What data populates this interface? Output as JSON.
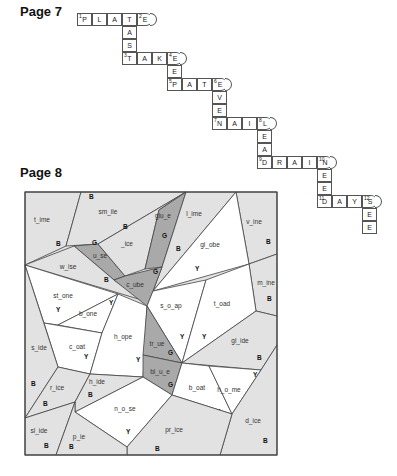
{
  "page7": {
    "label": "Page 7",
    "cells": [
      {
        "x": 77,
        "y": 13,
        "ch": "P",
        "num": "1"
      },
      {
        "x": 92,
        "y": 13,
        "ch": "L"
      },
      {
        "x": 107,
        "y": 13,
        "ch": "A"
      },
      {
        "x": 122,
        "y": 13,
        "ch": "T"
      },
      {
        "x": 137,
        "y": 13,
        "ch": "E",
        "num": "2",
        "end": true
      },
      {
        "x": 122,
        "y": 26,
        "ch": "A"
      },
      {
        "x": 122,
        "y": 39,
        "ch": "S"
      },
      {
        "x": 122,
        "y": 52,
        "ch": "T",
        "num": "3"
      },
      {
        "x": 137,
        "y": 52,
        "ch": "A"
      },
      {
        "x": 152,
        "y": 52,
        "ch": "K"
      },
      {
        "x": 167,
        "y": 52,
        "ch": "E",
        "num": "4",
        "end": true
      },
      {
        "x": 167,
        "y": 65,
        "ch": "E"
      },
      {
        "x": 167,
        "y": 78,
        "ch": "P",
        "num": "5"
      },
      {
        "x": 182,
        "y": 78,
        "ch": "A"
      },
      {
        "x": 197,
        "y": 78,
        "ch": "T"
      },
      {
        "x": 212,
        "y": 78,
        "ch": "E",
        "num": "6",
        "end": true
      },
      {
        "x": 212,
        "y": 91,
        "ch": "V"
      },
      {
        "x": 212,
        "y": 104,
        "ch": "E"
      },
      {
        "x": 212,
        "y": 117,
        "ch": "N",
        "num": "7"
      },
      {
        "x": 227,
        "y": 117,
        "ch": "A"
      },
      {
        "x": 242,
        "y": 117,
        "ch": "I"
      },
      {
        "x": 257,
        "y": 117,
        "ch": "L",
        "num": "8",
        "end": true
      },
      {
        "x": 257,
        "y": 130,
        "ch": "E"
      },
      {
        "x": 257,
        "y": 143,
        "ch": "A"
      },
      {
        "x": 257,
        "y": 156,
        "ch": "D",
        "num": "9"
      },
      {
        "x": 272,
        "y": 156,
        "ch": "R"
      },
      {
        "x": 287,
        "y": 156,
        "ch": "A"
      },
      {
        "x": 302,
        "y": 156,
        "ch": "I"
      },
      {
        "x": 317,
        "y": 156,
        "ch": "N",
        "num": "10",
        "end": true
      },
      {
        "x": 317,
        "y": 169,
        "ch": "E"
      },
      {
        "x": 317,
        "y": 182,
        "ch": "E"
      },
      {
        "x": 317,
        "y": 195,
        "ch": "D",
        "num": "11"
      },
      {
        "x": 332,
        "y": 195,
        "ch": "A"
      },
      {
        "x": 347,
        "y": 195,
        "ch": "Y"
      },
      {
        "x": 362,
        "y": 195,
        "ch": "S",
        "num": "12",
        "end": true
      },
      {
        "x": 362,
        "y": 208,
        "ch": "E"
      },
      {
        "x": 362,
        "y": 221,
        "ch": "E"
      }
    ]
  },
  "page8": {
    "label": "Page 8",
    "colors": {
      "B": "#e2e2e2",
      "G": "#a9a9a9",
      "Y": "#ffffff",
      "border": "#444444"
    },
    "regions": [
      {
        "name": "time",
        "color": "B",
        "points": "25,192 81,192 66,246 25,265",
        "word": "t_ime",
        "wx": 42,
        "wy": 222,
        "lx": 56,
        "ly": 246
      },
      {
        "name": "smile",
        "color": "B",
        "points": "81,192 186,192 98,244 66,246",
        "word": "sm_ile",
        "wx": 108,
        "wy": 214,
        "lx": 89,
        "ly": 199
      },
      {
        "name": "use",
        "color": "G",
        "points": "74,246 98,244 125,276 114,280",
        "word": "u_se",
        "wx": 100,
        "wy": 258,
        "lx": 92,
        "ly": 245
      },
      {
        "name": "ice",
        "color": "B",
        "points": "98,244 186,192 159,210 145,269 125,276",
        "word": "_ice",
        "wx": 127,
        "wy": 246,
        "lx": 123,
        "ly": 229
      },
      {
        "name": "glue",
        "color": "G",
        "points": "159,210 186,192 162,267 145,269",
        "word": "glu_e",
        "wx": 163,
        "wy": 218,
        "lx": 162,
        "ly": 238
      },
      {
        "name": "lime",
        "color": "B",
        "points": "186,192 236,192 153,291 162,267",
        "word": "l_ime",
        "wx": 194,
        "wy": 216,
        "lx": 176,
        "ly": 251
      },
      {
        "name": "vine",
        "color": "B",
        "points": "236,192 277,192 277,254 249,264",
        "word": "v_ine",
        "wx": 254,
        "wy": 224,
        "lx": 266,
        "ly": 244
      },
      {
        "name": "globe",
        "color": "Y",
        "points": "236,192 249,264 153,291",
        "word": "gl_obe",
        "wx": 210,
        "wy": 247,
        "lx": 195,
        "ly": 271
      },
      {
        "name": "wise",
        "color": "B",
        "points": "25,265 74,246 114,280 145,301 25,265",
        "word": "w_ise",
        "wx": 68,
        "wy": 269,
        "lx": 104,
        "ly": 282
      },
      {
        "name": "cube",
        "color": "G",
        "points": "114,280 125,276 162,267 153,291 147,306",
        "word": "c_ube",
        "wx": 135,
        "wy": 287,
        "lx": 153,
        "ly": 274
      },
      {
        "name": "mine",
        "color": "B",
        "points": "249,264 277,254 277,316 256,311",
        "word": "m_ine",
        "wx": 266,
        "wy": 285,
        "lx": 267,
        "ly": 301
      },
      {
        "name": "stone",
        "color": "Y",
        "points": "25,265 118,294 58,325 44,323",
        "word": "st_one",
        "wx": 63,
        "wy": 298,
        "lx": 56,
        "ly": 312
      },
      {
        "name": "bone",
        "color": "Y",
        "points": "58,325 118,294 102,333",
        "word": "b_one",
        "wx": 88,
        "wy": 316,
        "lx": 109,
        "ly": 305
      },
      {
        "name": "coat",
        "color": "Y",
        "points": "44,323 102,333 90,374 58,367",
        "word": "c_oat",
        "wx": 77,
        "wy": 349,
        "lx": 84,
        "ly": 359
      },
      {
        "name": "hope",
        "color": "Y",
        "points": "118,294 147,306 143,377 90,374 102,333",
        "word": "h_ope",
        "wx": 123,
        "wy": 339,
        "lx": 136,
        "ly": 362
      },
      {
        "name": "soap",
        "color": "Y",
        "points": "153,291 206,280 182,363 147,306",
        "word": "s_o_ap",
        "wx": 171,
        "wy": 308,
        "lx": 180,
        "ly": 339
      },
      {
        "name": "toad",
        "color": "Y",
        "points": "206,280 249,264 256,311 182,363",
        "word": "t_oad",
        "wx": 222,
        "wy": 306,
        "lx": 202,
        "ly": 339
      },
      {
        "name": "true",
        "color": "G",
        "points": "147,306 182,363 143,355",
        "word": "tr_ue",
        "wx": 157,
        "wy": 346,
        "lx": 168,
        "ly": 355
      },
      {
        "name": "glide",
        "color": "B",
        "points": "256,311 277,316 277,345 261,370 182,363",
        "word": "gl_ide",
        "wx": 240,
        "wy": 343,
        "lx": 257,
        "ly": 360
      },
      {
        "name": "side",
        "color": "B",
        "points": "25,265 58,367 25,418",
        "word": "s_ide",
        "wx": 39,
        "wy": 350,
        "lx": 31,
        "ly": 386
      },
      {
        "name": "blue",
        "color": "G",
        "points": "143,355 182,363 172,395 143,377",
        "word": "bl_u_e",
        "wx": 160,
        "wy": 374,
        "lx": 168,
        "ly": 387
      },
      {
        "name": "boat",
        "color": "Y",
        "points": "182,363 209,366 232,414 172,395",
        "word": "b_oat",
        "wx": 197,
        "wy": 390,
        "lx": 216,
        "ly": 414
      },
      {
        "name": "home",
        "color": "Y",
        "points": "209,366 261,370 232,414",
        "word": "h_o_me",
        "wx": 229,
        "wy": 392,
        "lx": 253,
        "ly": 377
      },
      {
        "name": "rice",
        "color": "B",
        "points": "58,367 90,374 75,402 25,418",
        "word": "r_ice",
        "wx": 57,
        "wy": 390,
        "lx": 43,
        "ly": 406
      },
      {
        "name": "hide",
        "color": "B",
        "points": "90,374 143,377 75,412 75,402",
        "word": "h_ide",
        "wx": 97,
        "wy": 384,
        "lx": 88,
        "ly": 397
      },
      {
        "name": "nose",
        "color": "Y",
        "points": "75,412 143,377 172,395 127,447",
        "word": "n_o_se",
        "wx": 125,
        "wy": 411,
        "lx": 126,
        "ly": 434
      },
      {
        "name": "dice",
        "color": "B",
        "points": "261,370 277,345 277,455 220,455 232,414",
        "word": "d_ice",
        "wx": 253,
        "wy": 423,
        "lx": 263,
        "ly": 443
      },
      {
        "name": "price",
        "color": "B",
        "points": "172,395 232,414 220,455 127,455 127,447",
        "word": "pr_ice",
        "wx": 174,
        "wy": 432,
        "lx": 155,
        "ly": 451
      },
      {
        "name": "slide",
        "color": "B",
        "points": "25,418 75,402 56,455 25,455",
        "word": "sl_ide",
        "wx": 39,
        "wy": 433,
        "lx": 44,
        "ly": 448
      },
      {
        "name": "pie",
        "color": "B",
        "points": "75,402 75,412 127,447 127,455 56,455",
        "word": "p_ie",
        "wx": 79,
        "wy": 439,
        "lx": 69,
        "ly": 449
      }
    ]
  }
}
